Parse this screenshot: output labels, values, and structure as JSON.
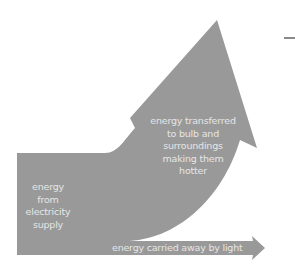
{
  "diagram": {
    "type": "sankey-energy-flow",
    "colors": {
      "arrow_fill": "#999999",
      "label_text": "#e6e6e6",
      "background": "#ffffff"
    },
    "input": {
      "lines": [
        "energy",
        "from",
        "electricity",
        "supply"
      ]
    },
    "outputs": [
      {
        "id": "heat",
        "lines": [
          "energy transferred",
          "to bulb and",
          "surroundings",
          "making them",
          "hotter"
        ]
      },
      {
        "id": "light",
        "label": "energy carried away by light"
      }
    ]
  }
}
